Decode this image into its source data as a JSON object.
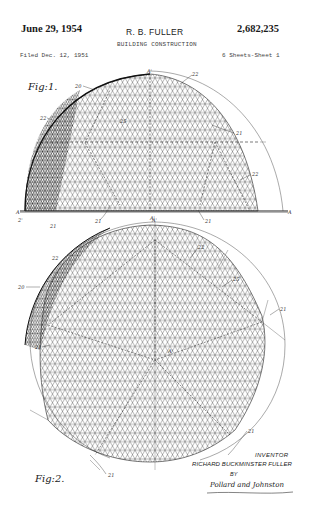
{
  "header": {
    "date": "June 29, 1954",
    "inventor_short": "R. B. FULLER",
    "patent_number": "2,682,235",
    "title": "BUILDING CONSTRUCTION",
    "filed": "Filed Dec. 12, 1951",
    "sheets": "6 Sheets-Sheet 1"
  },
  "figures": [
    {
      "label": "Fig:1.",
      "view": "elevation",
      "reference_numerals": [
        "20",
        "22",
        "22",
        "25",
        "21",
        "22",
        "A",
        "A",
        "A'",
        "A'",
        "21",
        "21",
        "21",
        "21"
      ]
    },
    {
      "label": "Fig:2.",
      "view": "plan",
      "reference_numerals": [
        "A'",
        "22",
        "22",
        "25",
        "20",
        "21",
        "21",
        "A'",
        "21",
        "21"
      ]
    }
  ],
  "signature_block": {
    "inventor_label": "INVENTOR",
    "inventor_name": "RICHARD BUCKMINSTER FULLER",
    "by_label": "BY",
    "attorney_signature": "Pollard and Johnston"
  },
  "colors": {
    "ink": "#1a1a1a",
    "paper": "#ffffff"
  }
}
